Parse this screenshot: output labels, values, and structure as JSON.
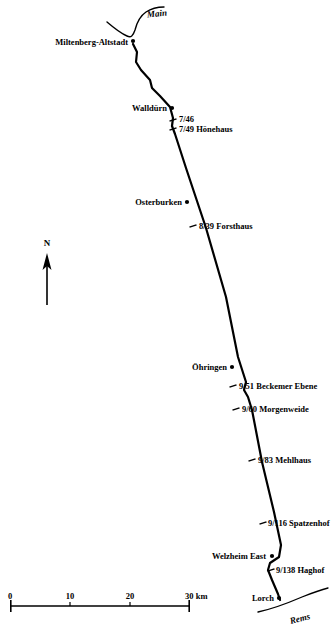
{
  "map": {
    "title_absent": true,
    "background_color": "#ffffff",
    "ink_color": "#000000",
    "width": 331,
    "height": 634,
    "rivers": [
      {
        "name": "main-river",
        "label": "Main",
        "label_x": 147,
        "label_y": 14
      },
      {
        "name": "rems-river",
        "label": "Rems",
        "label_x": 300,
        "label_y": 619
      }
    ],
    "north_arrow": {
      "label": "N",
      "label_x": 47,
      "label_y": 248,
      "tip_x": 47,
      "tip_y": 254,
      "tail_y": 305
    },
    "scalebar": {
      "unit": "km",
      "x_start": 10,
      "x_end": 190,
      "y": 606,
      "ticks": [
        {
          "label": "0",
          "x": 10
        },
        {
          "label": "10",
          "x": 70
        },
        {
          "label": "20",
          "x": 130
        },
        {
          "label": "30 km",
          "x": 190
        }
      ]
    },
    "route_points": [
      {
        "x": 133,
        "y": 44
      },
      {
        "x": 137,
        "y": 52
      },
      {
        "x": 136,
        "y": 62
      },
      {
        "x": 141,
        "y": 70
      },
      {
        "x": 150,
        "y": 80
      },
      {
        "x": 152,
        "y": 88
      },
      {
        "x": 160,
        "y": 96
      },
      {
        "x": 170,
        "y": 107
      },
      {
        "x": 173,
        "y": 118
      },
      {
        "x": 172,
        "y": 126
      },
      {
        "x": 175,
        "y": 134
      },
      {
        "x": 186,
        "y": 168
      },
      {
        "x": 197,
        "y": 201
      },
      {
        "x": 206,
        "y": 228
      },
      {
        "x": 226,
        "y": 297
      },
      {
        "x": 238,
        "y": 357
      },
      {
        "x": 246,
        "y": 382
      },
      {
        "x": 244,
        "y": 390
      },
      {
        "x": 248,
        "y": 397
      },
      {
        "x": 252,
        "y": 410
      },
      {
        "x": 262,
        "y": 462
      },
      {
        "x": 274,
        "y": 512
      },
      {
        "x": 281,
        "y": 545
      },
      {
        "x": 279,
        "y": 557
      },
      {
        "x": 270,
        "y": 563
      },
      {
        "x": 268,
        "y": 570
      },
      {
        "x": 272,
        "y": 580
      },
      {
        "x": 278,
        "y": 594
      },
      {
        "x": 280,
        "y": 600
      }
    ],
    "stations": [
      {
        "name": "miltenberg-altstadt",
        "label": "Miltenberg-Altstadt",
        "marker": "dot",
        "marker_x": 133,
        "marker_y": 41,
        "label_x": 128,
        "label_y": 42,
        "label_side": "left"
      },
      {
        "name": "wallduern",
        "label": "Walldürn",
        "marker": "dot",
        "marker_x": 172,
        "marker_y": 108,
        "label_x": 167,
        "label_y": 108,
        "label_side": "left"
      },
      {
        "name": "746",
        "label": "7/46",
        "marker": "tick",
        "marker_x": 173,
        "marker_y": 120,
        "label_x": 179,
        "label_y": 119,
        "label_side": "right"
      },
      {
        "name": "749-hoenehaus",
        "label": "7/49 Hönehaus",
        "marker": "tick",
        "marker_x": 173,
        "marker_y": 129,
        "label_x": 179,
        "label_y": 129,
        "label_side": "right"
      },
      {
        "name": "osterburken",
        "label": "Osterburken",
        "marker": "dot",
        "marker_x": 187,
        "marker_y": 202,
        "label_x": 182,
        "label_y": 202,
        "label_side": "left"
      },
      {
        "name": "839-forsthaus",
        "label": "8/39 Forsthaus",
        "marker": "tick",
        "marker_x": 193,
        "marker_y": 226,
        "label_x": 199,
        "label_y": 226,
        "label_side": "right"
      },
      {
        "name": "oehringen",
        "label": "Öhringen",
        "marker": "dot",
        "marker_x": 232,
        "marker_y": 367,
        "label_x": 227,
        "label_y": 367,
        "label_side": "left"
      },
      {
        "name": "951-beckemer-ebene",
        "label": "9/51 Beckemer Ebene",
        "marker": "tick",
        "marker_x": 233,
        "marker_y": 386,
        "label_x": 239,
        "label_y": 386,
        "label_side": "right"
      },
      {
        "name": "960-morgenweide",
        "label": "9/60 Morgenweide",
        "marker": "tick",
        "marker_x": 236,
        "marker_y": 409,
        "label_x": 242,
        "label_y": 409,
        "label_side": "right"
      },
      {
        "name": "983-mehlhaus",
        "label": "9/83 Mehlhaus",
        "marker": "tick",
        "marker_x": 252,
        "marker_y": 460,
        "label_x": 258,
        "label_y": 460,
        "label_side": "right"
      },
      {
        "name": "9116-spatzenhof",
        "label": "9/116 Spatzenhof",
        "marker": "tick",
        "marker_x": 263,
        "marker_y": 523,
        "label_x": 268,
        "label_y": 523,
        "label_side": "right"
      },
      {
        "name": "welzheim-east",
        "label": "Welzheim East",
        "marker": "dot",
        "marker_x": 272,
        "marker_y": 556,
        "label_x": 266,
        "label_y": 556,
        "label_side": "left"
      },
      {
        "name": "9138-haghof",
        "label": "9/138 Haghof",
        "marker": "tick",
        "marker_x": 271,
        "marker_y": 570,
        "label_x": 276,
        "label_y": 570,
        "label_side": "right"
      },
      {
        "name": "lorch",
        "label": "Lorch",
        "marker": "dot",
        "marker_x": 279,
        "marker_y": 598,
        "label_x": 274,
        "label_y": 598,
        "label_side": "left"
      }
    ]
  }
}
